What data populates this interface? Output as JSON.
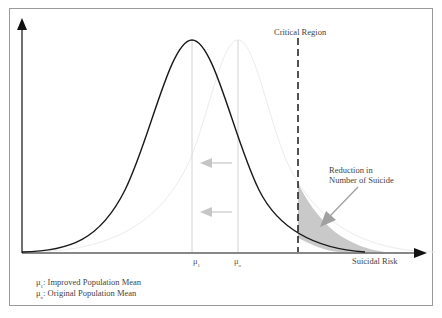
{
  "diagram": {
    "axis_x_label": "Suicidal Risk",
    "critical_region_label": "Critical Region",
    "annotation": {
      "line1": "Reduction in",
      "line2": "Number of Suicide"
    },
    "mean_markers": [
      {
        "symbol": "μ",
        "subscript": "1"
      },
      {
        "symbol": "μ",
        "subscript": "o"
      }
    ],
    "legend": [
      {
        "symbol": "μ",
        "subscript": "1",
        "text": ": Improved Population Mean"
      },
      {
        "symbol": "μ",
        "subscript": "o",
        "text": ": Original Population Mean"
      }
    ],
    "colors": {
      "improved_curve": "#1a1a1a",
      "original_curve": "#e6e6e6",
      "shaded_region": "#c8c8c8",
      "mean_lines": "#d0d0d0",
      "shift_arrows": "#c8c8c8",
      "annotation_arrow": "#a0a0a0"
    }
  }
}
